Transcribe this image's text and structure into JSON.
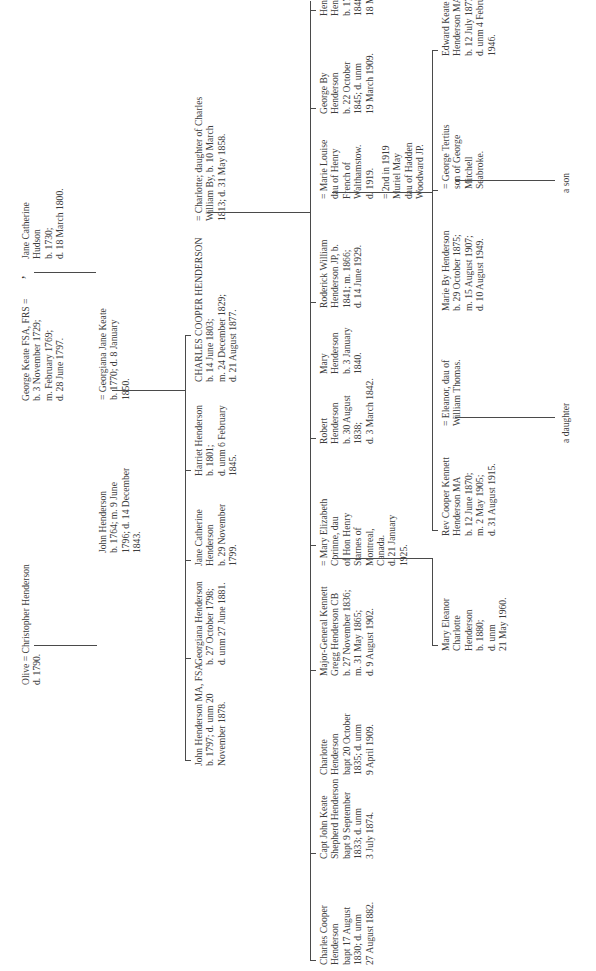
{
  "diagram": {
    "type": "family-tree",
    "orientation": "rotated-90-ccw",
    "generations": [
      {
        "level": 1,
        "couples": [
          {
            "id": "christopher",
            "text": "Olive = Christopher Henderson\nd. 1790."
          },
          {
            "id": "george-keate",
            "text": "George Keate FSA, FRS =\nb. 3 November 1729;\nm. February 1769;\nd. 28 June 1797."
          },
          {
            "id": "jane-hudson",
            "text": "Jane Catherine\nHudson\nb. 1730;\nd. 18 March 1800."
          }
        ]
      },
      {
        "level": 2,
        "people": [
          {
            "id": "john-1764",
            "text": "John Henderson\nb. 1764; m. 9 June\n1796; d. 14 December\n1843."
          },
          {
            "id": "georgiana-keate",
            "text": "= Georgiana Jane Keate\nb. 1770; d. 8 January\n1850."
          }
        ]
      },
      {
        "level": 3,
        "people": [
          {
            "id": "john-1797",
            "text": "John Henderson MA, FSA\nb. 1797; d. unm 20\nNovember 1878."
          },
          {
            "id": "georgiana-1798",
            "text": "Georgiana Henderson\nb. 27 October 1798;\nd. unm 27 June 1881."
          },
          {
            "id": "jane-1799",
            "text": "Jane Catherine\nHenderson\nb. 29 November\n1799."
          },
          {
            "id": "harriet-1801",
            "text": "Harriet Henderson\nb. 1801;\nd. unm 6 February\n1845."
          },
          {
            "id": "charles-1803",
            "text": "CHARLES COOPER HENDERSON\nb. 14 June 1803;\nm. 24 December 1829;\nd. 21 August 1877."
          },
          {
            "id": "charlotte-by",
            "text": "= Charlotte; daughter of Charles\nWilliam By, b. 10 March\n1813; d. 31 May 1858."
          }
        ]
      },
      {
        "level": 4,
        "people": [
          {
            "id": "charles-1830",
            "text": "Charles Cooper\nHenderson\nbapt 17 August\n1830; d. unm\n27 August 1882."
          },
          {
            "id": "john-keate-1833",
            "text": "Capt John Keate\nShepherd Henderson\nbapt 9 September\n1833; d. unm\n3 July 1874."
          },
          {
            "id": "charlotte-1835",
            "text": "Charlotte\nHenderson\nbapt 20 October\n1835; d. unm\n9 April 1909."
          },
          {
            "id": "kennett-1836",
            "text": "Major-General Kennett\nGregg Henderson CB\nb. 27 November 1836;\nm. 31 May 1865;\nd. 9 August 1902."
          },
          {
            "id": "mary-elizabeth",
            "text": "= Mary Elizabeth\nCorinne, dau\nof Hon Henry\nStarnes of\nMontreal,\nCanada.\nd. 21 January\n1925."
          },
          {
            "id": "robert-1838",
            "text": "Robert\nHenderson\nb. 30 August\n1838;\nd. 3 March 1842."
          },
          {
            "id": "mary-1840",
            "text": "Mary\nHenderson\nb. 3 January\n1840."
          },
          {
            "id": "roderick-1841",
            "text": "Roderick William\nHenderson JP, b.\n1841; m. 1866;\nd. 14 June 1929."
          },
          {
            "id": "marie-louise",
            "text": "= Marie Louise\ndau of Henry\nFrench of\nWalthamstow.\nd. 1919."
          },
          {
            "id": "muriel-may",
            "text": "= 2nd in 1919\nMuriel May\ndau of Hadden\nWoodward JP."
          },
          {
            "id": "george-by-1845",
            "text": "George By\nHenderson\nb. 22 October\n1845; d. unm\n19 March 1909."
          },
          {
            "id": "henry-1848",
            "text": "Henry Cooper\nHenderson\nb. 17 April\n1848; d. unm\n18 May 1913."
          }
        ]
      },
      {
        "level": 5,
        "people": [
          {
            "id": "mary-eleanor-1880",
            "text": "Mary Eleanor\nCharlotte\nHenderson\nb. 1880;\nd. unm\n21 May 1960."
          },
          {
            "id": "cooper-kennett-1870",
            "text": "Rev Cooper Kennett\nHenderson MA\nb. 12 June 1870;\nm. 2 May 1905;\nd. 31 August 1915."
          },
          {
            "id": "eleanor-thomas",
            "text": "= Eleanor, dau of\nWilliam Thomas."
          },
          {
            "id": "marie-by-1875",
            "text": "Marie By Henderson\nb. 29 October 1875;\nm. 15 August 1907;\nd. 10 August 1949."
          },
          {
            "id": "george-tertius",
            "text": "= George Tertius\nson of George\nMitchell\nSeabroke."
          },
          {
            "id": "edward-keate-1877",
            "text": "Edward Keate\nHenderson MA\nb. 12 July 1877;\nd. unm 4 February\n1946."
          }
        ]
      },
      {
        "level": 6,
        "people": [
          {
            "id": "a-daughter",
            "text": "a daughter"
          },
          {
            "id": "a-son",
            "text": "a son"
          }
        ]
      }
    ]
  }
}
